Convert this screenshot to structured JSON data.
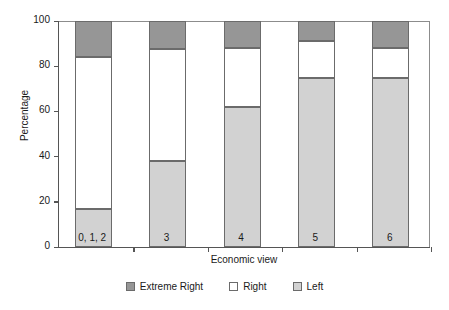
{
  "chart_data": {
    "type": "bar",
    "subtype": "stacked-percentage",
    "title": "",
    "xlabel": "Economic view",
    "ylabel": "Percentage",
    "categories": [
      "0, 1, 2",
      "3",
      "4",
      "5",
      "6"
    ],
    "ylim": [
      0,
      100
    ],
    "yticks": [
      0,
      20,
      40,
      60,
      80,
      100
    ],
    "ytick_labels": [
      "0",
      "20",
      "40",
      "60",
      "80",
      "100"
    ],
    "grid": false,
    "legend_position": "bottom-center",
    "stack_order_bottom_to_top": [
      "Left",
      "Right",
      "Extreme Right"
    ],
    "series": [
      {
        "name": "Left",
        "color": "#d2d2d2",
        "values": [
          17,
          38,
          62,
          75,
          75
        ]
      },
      {
        "name": "Right",
        "color": "#ffffff",
        "values": [
          67,
          49.5,
          26,
          16,
          13
        ]
      },
      {
        "name": "Extreme Right",
        "color": "#969696",
        "values": [
          16,
          12.5,
          12,
          9,
          12
        ]
      }
    ],
    "cumulative_tops": {
      "Left": [
        17,
        38,
        62,
        75,
        75
      ],
      "Right": [
        84,
        87.5,
        88,
        91,
        88
      ],
      "Extreme Right": [
        100,
        100,
        100,
        100,
        100
      ]
    }
  },
  "legend": {
    "items": [
      {
        "label": "Extreme Right",
        "swatch": "#969696"
      },
      {
        "label": "Right",
        "swatch": "#ffffff"
      },
      {
        "label": "Left",
        "swatch": "#d2d2d2"
      }
    ]
  },
  "axes": {
    "y_title": "Percentage",
    "x_title": "Economic view"
  }
}
